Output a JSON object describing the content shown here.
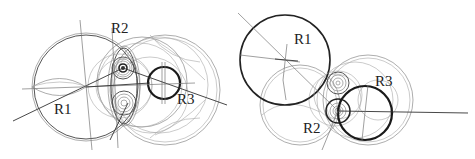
{
  "figure": {
    "colors": {
      "background": "#ffffff",
      "ink": "#1a1a1a",
      "construction": "#8a8a8a"
    }
  },
  "left_diagram": {
    "labels": {
      "r1": "R1",
      "r2": "R2",
      "r3": "R3"
    },
    "circles": {
      "r1": {
        "cx": 86,
        "cy": 87,
        "r": 52
      },
      "r2_gear": {
        "cx": 123,
        "cy": 68,
        "r": 4
      },
      "r2_lower_gear": {
        "cx": 124,
        "cy": 103,
        "r": 9
      },
      "r3": {
        "cx": 164,
        "cy": 83,
        "r": 16
      },
      "outer_right": {
        "cx": 165,
        "cy": 90,
        "r": 55
      }
    }
  },
  "right_diagram": {
    "labels": {
      "r1": "R1",
      "r2": "R2",
      "r3": "R3"
    },
    "circles": {
      "r1": {
        "cx": 285,
        "cy": 60,
        "r": 45
      },
      "r2": {
        "cx": 338,
        "cy": 111,
        "r": 12
      },
      "r2_upper_gear": {
        "cx": 338,
        "cy": 83,
        "r": 10
      },
      "r3": {
        "cx": 365,
        "cy": 113,
        "r": 27
      },
      "outer_right": {
        "cx": 368,
        "cy": 100,
        "r": 45
      }
    }
  }
}
